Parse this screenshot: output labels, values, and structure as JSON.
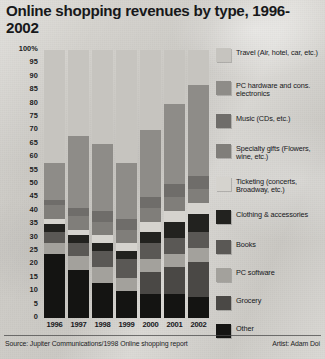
{
  "title": "Online shopping revenues by type, 1996-2002",
  "footer": {
    "source": "Source: Jupiter Communications/1998 Online shopping report",
    "artist": "Artist: Adam Doi"
  },
  "axis": {
    "y_ticks": [
      "100%",
      "95",
      "90",
      "85",
      "80",
      "75",
      "70",
      "65",
      "60",
      "55",
      "50",
      "45",
      "40",
      "35",
      "30",
      "25",
      "20",
      "15",
      "10",
      "5",
      "0"
    ],
    "x_ticks": [
      "1996",
      "1997",
      "1998",
      "1999",
      "2000",
      "2001",
      "2002"
    ]
  },
  "legend": {
    "items": [
      {
        "label": "Travel (Air, hotel, car, etc.)",
        "color": "#c6c4bf"
      },
      {
        "label": "PC hardware and cons. electronics",
        "color": "#8e8c88"
      },
      {
        "label": "Music (CDs, etc.)",
        "color": "#6f6d6a"
      },
      {
        "label": "Specialty gifts (Flowers, wine, etc.)",
        "color": "#807e7a"
      },
      {
        "label": "Ticketing (concerts, Broadway, etc.)",
        "color": "#d5d3ce"
      },
      {
        "label": "Clothing & accessories",
        "color": "#22221f"
      },
      {
        "label": "Books",
        "color": "#5a5855"
      },
      {
        "label": "PC software",
        "color": "#a3a19c"
      },
      {
        "label": "Grocery",
        "color": "#4a4845"
      },
      {
        "label": "Other",
        "color": "#141412"
      }
    ]
  },
  "chart_data": {
    "type": "bar",
    "subtype": "stacked-100-percent",
    "title": "Online shopping revenues by type, 1996-2002",
    "xlabel": "",
    "ylabel": "",
    "ylim": [
      0,
      100
    ],
    "grid": false,
    "legend_position": "right",
    "categories": [
      "1996",
      "1997",
      "1998",
      "1999",
      "2000",
      "2001",
      "2002"
    ],
    "series": [
      {
        "name": "Other",
        "color": "#141412",
        "values": [
          24,
          18,
          13,
          10,
          9,
          9,
          8
        ]
      },
      {
        "name": "Grocery",
        "color": "#4a4845",
        "values": [
          0,
          0,
          0,
          0,
          8,
          10,
          13
        ]
      },
      {
        "name": "PC software",
        "color": "#a3a19c",
        "values": [
          4,
          5,
          6,
          5,
          5,
          5,
          5
        ]
      },
      {
        "name": "Books",
        "color": "#5a5855",
        "values": [
          4,
          5,
          6,
          7,
          6,
          6,
          6
        ]
      },
      {
        "name": "Clothing & accessories",
        "color": "#22221f",
        "values": [
          3,
          3,
          3,
          3,
          4,
          6,
          7
        ]
      },
      {
        "name": "Ticketing (concerts, Broadway, etc.)",
        "color": "#d5d3ce",
        "values": [
          2,
          2,
          3,
          3,
          4,
          4,
          4
        ]
      },
      {
        "name": "Specialty gifts (Flowers, wine, etc.)",
        "color": "#807e7a",
        "values": [
          5,
          5,
          5,
          5,
          5,
          5,
          5
        ]
      },
      {
        "name": "Music (CDs, etc.)",
        "color": "#6f6d6a",
        "values": [
          2,
          3,
          4,
          4,
          4,
          5,
          5
        ]
      },
      {
        "name": "PC hardware and cons. electronics",
        "color": "#8e8c88",
        "values": [
          14,
          27,
          25,
          21,
          25,
          30,
          34
        ]
      },
      {
        "name": "Travel (Air, hotel, car, etc.)",
        "color": "#c6c4bf",
        "values": [
          42,
          32,
          35,
          42,
          30,
          20,
          13
        ]
      }
    ]
  }
}
